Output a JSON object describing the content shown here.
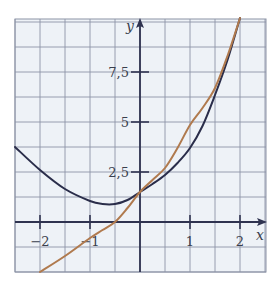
{
  "chart_data": {
    "type": "line",
    "title": "",
    "xlabel": "x",
    "ylabel": "y",
    "xlim": [
      -2.5,
      2.5
    ],
    "ylim": [
      -2.5,
      10.0
    ],
    "grid": true,
    "grid_step": {
      "x": 0.5,
      "y": 1.25
    },
    "x_ticks": [
      -2,
      -1,
      1,
      2
    ],
    "x_tick_labels": [
      "−2",
      "−1",
      "1",
      "2"
    ],
    "y_ticks": [
      2.5,
      5,
      7.5
    ],
    "y_tick_labels": [
      "2,5",
      "5",
      "7,5"
    ],
    "legend": null,
    "series": [
      {
        "name": "dark curve",
        "color": "#2a2d4a",
        "x": [
          -2.5,
          -2.0,
          -1.5,
          -1.0,
          -0.75,
          -0.5,
          -0.25,
          0.0,
          0.25,
          0.5,
          0.75,
          1.0,
          1.25,
          1.5,
          1.75,
          2.0
        ],
        "y": [
          3.75,
          2.6,
          1.65,
          1.05,
          0.9,
          0.9,
          1.1,
          1.5,
          1.9,
          2.35,
          2.95,
          3.7,
          4.8,
          6.35,
          8.1,
          10.2
        ]
      },
      {
        "name": "orange curve",
        "color": "#b07a4e",
        "x": [
          -2.0,
          -1.5,
          -1.0,
          -0.75,
          -0.5,
          -0.25,
          0.0,
          0.25,
          0.5,
          0.75,
          1.0,
          1.25,
          1.5,
          1.75,
          2.0
        ],
        "y": [
          -2.5,
          -1.7,
          -0.8,
          -0.4,
          0.0,
          0.7,
          1.5,
          2.1,
          2.7,
          3.7,
          4.85,
          5.7,
          6.7,
          8.3,
          10.2
        ]
      }
    ]
  },
  "axes": {
    "x_label": "x",
    "y_label": "y"
  }
}
